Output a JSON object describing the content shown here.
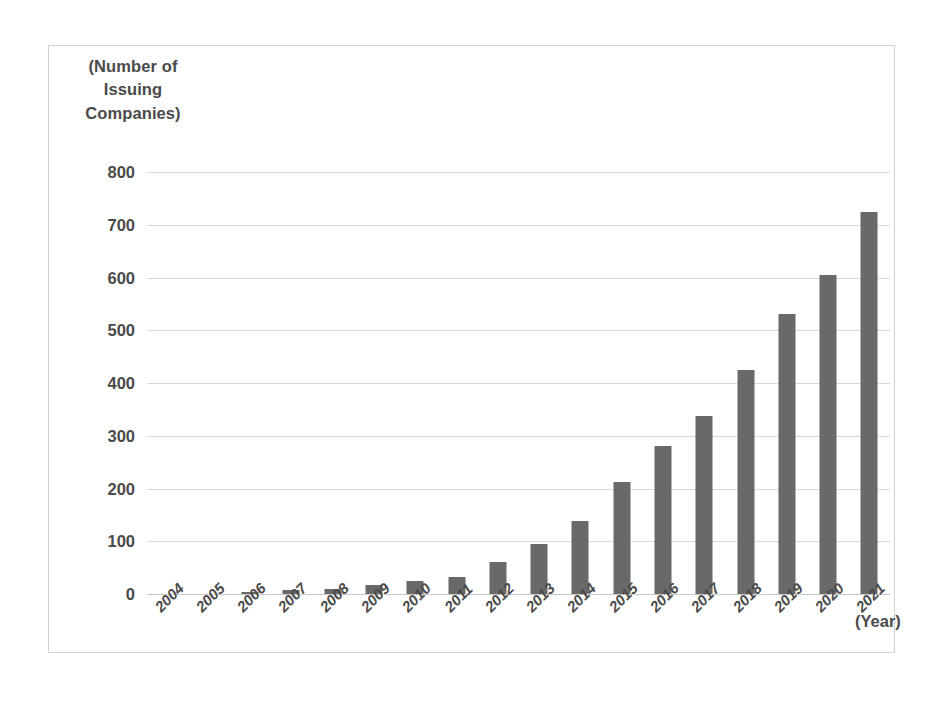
{
  "chart_data": {
    "type": "bar",
    "title": "",
    "ylabel": "(Number of Issuing Companies)",
    "xlabel": "(Year)",
    "categories": [
      "2004",
      "2005",
      "2006",
      "2007",
      "2008",
      "2009",
      "2010",
      "2011",
      "2012",
      "2013",
      "2014",
      "2015",
      "2016",
      "2017",
      "2018",
      "2019",
      "2020",
      "2021"
    ],
    "values": [
      0,
      0,
      3,
      7,
      10,
      17,
      25,
      33,
      60,
      95,
      138,
      212,
      280,
      337,
      425,
      530,
      605,
      725
    ],
    "ylim": [
      0,
      800
    ],
    "ytick_labels": [
      "800",
      "700",
      "600",
      "500",
      "400",
      "300",
      "200",
      "100",
      "0"
    ],
    "ytick_values": [
      800,
      700,
      600,
      500,
      400,
      300,
      200,
      100,
      0
    ],
    "grid": true,
    "legend": false,
    "series": [
      {
        "name": "Number of Issuing Companies",
        "color": "#696969"
      }
    ]
  },
  "axes": {
    "y_title_lines": [
      "(Number of",
      "Issuing",
      "Companies)"
    ],
    "x_title": "(Year)"
  },
  "colors": {
    "bar": "#696969",
    "gridline": "#d9d9d9",
    "text": "#4a4a4a",
    "outer_border": "#3b3b3b",
    "inner_border": "#d3d3d3",
    "background": "#ffffff"
  }
}
